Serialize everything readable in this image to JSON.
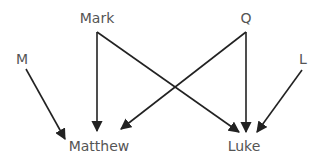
{
  "diagram": {
    "type": "dependency graph",
    "nodes": [
      {
        "id": "mark",
        "label": "Mark"
      },
      {
        "id": "q",
        "label": "Q"
      },
      {
        "id": "m",
        "label": "M"
      },
      {
        "id": "l",
        "label": "L"
      },
      {
        "id": "matthew",
        "label": "Matthew"
      },
      {
        "id": "luke",
        "label": "Luke"
      }
    ],
    "edges": [
      {
        "from": "M",
        "to": "Matthew"
      },
      {
        "from": "Mark",
        "to": "Matthew"
      },
      {
        "from": "Mark",
        "to": "Luke"
      },
      {
        "from": "Q",
        "to": "Matthew"
      },
      {
        "from": "Q",
        "to": "Luke"
      },
      {
        "from": "L",
        "to": "Luke"
      }
    ],
    "colors": {
      "edge": "#222222",
      "label": "#555555",
      "background": "#ffffff"
    }
  }
}
